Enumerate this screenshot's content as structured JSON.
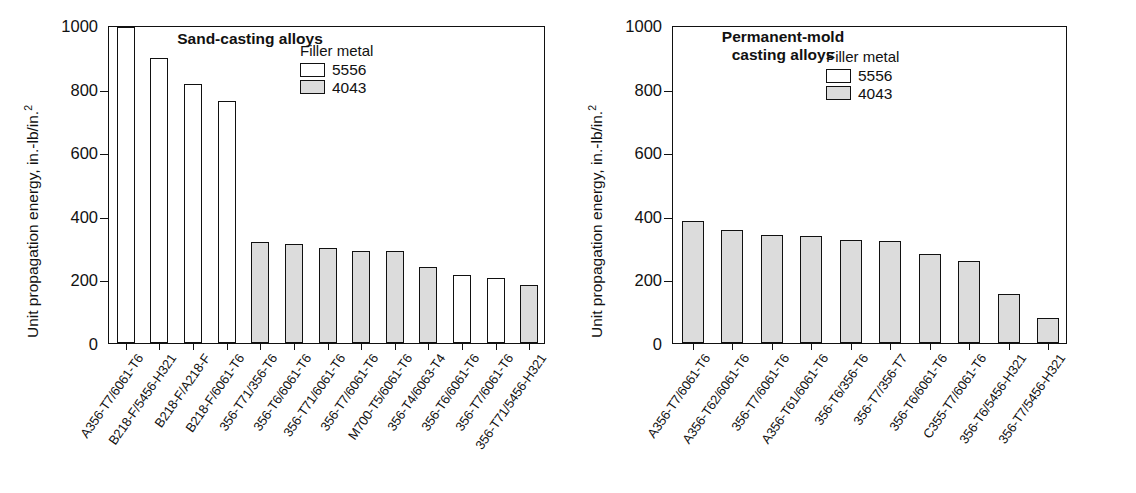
{
  "chart_data": [
    {
      "type": "bar",
      "panel": "left",
      "title": "Sand-casting alloys",
      "xlabel": "",
      "ylabel": "Unit propagation energy, in.-lb/in.",
      "ylabel_exponent": "2",
      "ylim": [
        0,
        1000
      ],
      "yticks": [
        0,
        200,
        400,
        600,
        800,
        1000
      ],
      "ytick_labels": [
        "0",
        "200",
        "400",
        "600",
        "800",
        "1000"
      ],
      "grid": false,
      "legend": {
        "title": "Filler metal",
        "position": "top-right-inside",
        "entries": [
          {
            "label": "5556",
            "fill": "#ffffff"
          },
          {
            "label": "4043",
            "fill": "#dcdcdc"
          }
        ]
      },
      "categories": [
        "A356-T7/6061-T6",
        "B218-F/5456-H321",
        "B218-F/A218-F",
        "B218-F/6061-T6",
        "356-T71/356-T6",
        "356-T6/6061-T6",
        "356-T71/6061-T6",
        "356-T7/6061-T6",
        "M700-T5/6061-T6",
        "356-T4/6063-T4",
        "356-T6/6061-T6",
        "356-T7/6061-T6",
        "356-T71/5456-H321"
      ],
      "values": [
        995,
        897,
        815,
        762,
        318,
        310,
        300,
        288,
        288,
        239,
        213,
        205,
        184
      ],
      "series_of_bar": [
        "5556",
        "5556",
        "5556",
        "5556",
        "4043",
        "4043",
        "4043",
        "4043",
        "4043",
        "4043",
        "5556",
        "5556",
        "4043"
      ]
    },
    {
      "type": "bar",
      "panel": "right",
      "title": "Permanent-mold\ncasting alloys",
      "xlabel": "",
      "ylabel": "Unit propagation energy, in.-lb/in.",
      "ylabel_exponent": "2",
      "ylim": [
        0,
        1000
      ],
      "yticks": [
        0,
        200,
        400,
        600,
        800,
        1000
      ],
      "ytick_labels": [
        "0",
        "200",
        "400",
        "600",
        "800",
        "1000"
      ],
      "grid": false,
      "legend": {
        "title": "Filler metal",
        "position": "top-right-inside",
        "entries": [
          {
            "label": "5556",
            "fill": "#ffffff"
          },
          {
            "label": "4043",
            "fill": "#dcdcdc"
          }
        ]
      },
      "categories": [
        "A356-T7/6061-T6",
        "A356-T62/6061-T6",
        "356-T7/6061-T6",
        "A356-T61/6061-T6",
        "356-T6/356-T6",
        "356-T7/356-T7",
        "356-T6/6061-T6",
        "C355-T7/6061-T6",
        "356-T6/5456-H321",
        "356-T7/5456-H321"
      ],
      "values": [
        385,
        355,
        341,
        338,
        325,
        320,
        280,
        258,
        155,
        78
      ],
      "series_of_bar": [
        "4043",
        "4043",
        "4043",
        "4043",
        "4043",
        "4043",
        "4043",
        "4043",
        "4043",
        "4043"
      ]
    }
  ],
  "colors": {
    "fill_5556": "#ffffff",
    "fill_4043": "#dcdcdc",
    "line": "#111111",
    "background": "#ffffff"
  }
}
